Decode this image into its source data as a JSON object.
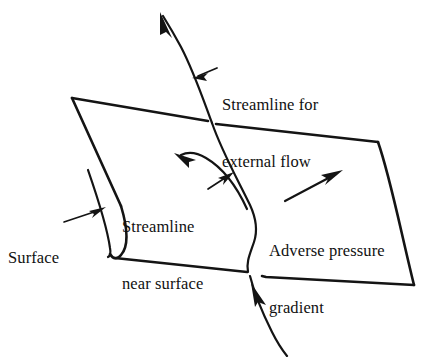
{
  "figure": {
    "stroke_color": "#141414",
    "background_color": "#ffffff"
  },
  "labels": {
    "streamline_external": {
      "line1": "Streamline for",
      "line2": "external flow"
    },
    "streamline_near_surface": {
      "line1": "Streamline",
      "line2": "near surface"
    },
    "adverse_pressure_gradient": {
      "line1": "Adverse pressure",
      "line2": "gradient"
    },
    "surface": {
      "line1": "Surface"
    }
  },
  "icons": {
    "arrow_external_flow": "arrow-up-left-icon",
    "arrow_incoming_flow": "arrow-up-left-icon",
    "arrow_near_surface_flow": "arrow-up-left-icon",
    "arrow_adverse_pressure": "arrow-up-right-icon",
    "leader_streamline_external": "leader-arrow-left-icon",
    "leader_streamline_near_surface": "leader-arrow-up-right-icon",
    "leader_surface": "leader-arrow-right-icon"
  }
}
